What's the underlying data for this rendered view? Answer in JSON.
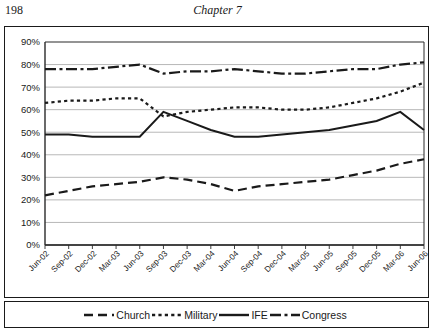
{
  "page": {
    "number": "198",
    "chapter_title": "Chapter 7"
  },
  "chart_data": {
    "type": "line",
    "title": "",
    "xlabel": "",
    "ylabel": "",
    "ylim": [
      0,
      90
    ],
    "ytick_labels": [
      "0%",
      "10%",
      "20%",
      "30%",
      "40%",
      "50%",
      "60%",
      "70%",
      "80%",
      "90%"
    ],
    "ytick_values": [
      0,
      10,
      20,
      30,
      40,
      50,
      60,
      70,
      80,
      90
    ],
    "grid": true,
    "legend_position": "bottom",
    "categories": [
      "Jun-02",
      "Sep-02",
      "Dec-02",
      "Mar-03",
      "Jun-03",
      "Sep-03",
      "Dec-03",
      "Mar-04",
      "Jun-04",
      "Sep-04",
      "Dec-04",
      "Mar-05",
      "Jun-05",
      "Sep-05",
      "Dec-05",
      "Mar-06",
      "Jun-06"
    ],
    "series": [
      {
        "name": "Church",
        "style": "long-dash",
        "color": "#1a1a1a",
        "values": [
          22,
          24,
          26,
          27,
          28,
          30,
          29,
          27,
          24,
          26,
          27,
          28,
          29,
          31,
          33,
          36,
          38
        ]
      },
      {
        "name": "Military",
        "style": "dotted",
        "color": "#1a1a1a",
        "values": [
          63,
          64,
          64,
          65,
          65,
          57,
          59,
          60,
          61,
          61,
          60,
          60,
          61,
          63,
          65,
          68,
          72
        ]
      },
      {
        "name": "IFE",
        "style": "solid",
        "color": "#1a1a1a",
        "values": [
          49,
          49,
          48,
          48,
          48,
          59,
          55,
          51,
          48,
          48,
          49,
          50,
          51,
          53,
          55,
          59,
          51
        ]
      },
      {
        "name": "Congress",
        "style": "dash-dot",
        "color": "#1a1a1a",
        "values": [
          78,
          78,
          78,
          79,
          80,
          76,
          77,
          77,
          78,
          77,
          76,
          76,
          77,
          78,
          78,
          80,
          81
        ]
      }
    ]
  },
  "legend": {
    "items": [
      {
        "label": "Church",
        "swatch": "long-dash-swatch"
      },
      {
        "label": "Military",
        "swatch": "dotted-swatch"
      },
      {
        "label": "IFE",
        "swatch": "solid-swatch"
      },
      {
        "label": "Congress",
        "swatch": "dash-dot-swatch"
      }
    ]
  }
}
